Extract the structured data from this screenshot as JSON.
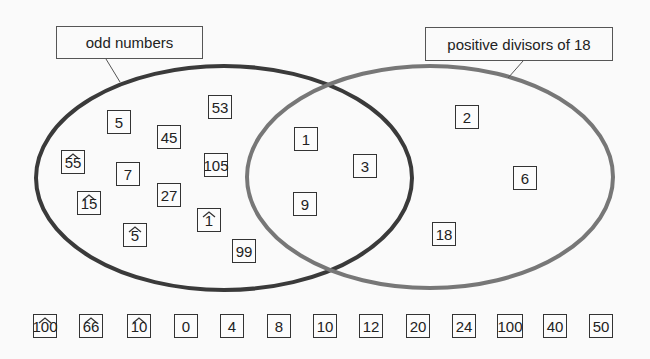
{
  "sets": {
    "left": {
      "label": "odd numbers",
      "stroke": "#3a3a3a"
    },
    "right": {
      "label": "positive divisors of 18",
      "stroke": "#777777"
    }
  },
  "only_left": [
    {
      "value": "53",
      "hat": false,
      "x": 208,
      "y": 95,
      "w": 24,
      "h": 24
    },
    {
      "value": "5",
      "hat": false,
      "x": 107,
      "y": 110,
      "w": 24,
      "h": 24
    },
    {
      "value": "45",
      "hat": false,
      "x": 157,
      "y": 125,
      "w": 24,
      "h": 24
    },
    {
      "value": "55",
      "hat": true,
      "x": 61,
      "y": 150,
      "w": 24,
      "h": 24
    },
    {
      "value": "105",
      "hat": false,
      "x": 204,
      "y": 153,
      "w": 24,
      "h": 24
    },
    {
      "value": "7",
      "hat": false,
      "x": 116,
      "y": 162,
      "w": 24,
      "h": 24
    },
    {
      "value": "27",
      "hat": false,
      "x": 157,
      "y": 183,
      "w": 24,
      "h": 24
    },
    {
      "value": "15",
      "hat": true,
      "x": 77,
      "y": 191,
      "w": 24,
      "h": 24
    },
    {
      "value": "1",
      "hat": true,
      "x": 197,
      "y": 208,
      "w": 24,
      "h": 24
    },
    {
      "value": "5",
      "hat": true,
      "x": 123,
      "y": 223,
      "w": 24,
      "h": 24
    },
    {
      "value": "99",
      "hat": false,
      "x": 232,
      "y": 239,
      "w": 24,
      "h": 24
    }
  ],
  "intersection": [
    {
      "value": "1",
      "hat": false,
      "x": 294,
      "y": 127,
      "w": 24,
      "h": 24
    },
    {
      "value": "3",
      "hat": false,
      "x": 353,
      "y": 154,
      "w": 24,
      "h": 24
    },
    {
      "value": "9",
      "hat": false,
      "x": 293,
      "y": 192,
      "w": 24,
      "h": 24
    }
  ],
  "only_right": [
    {
      "value": "2",
      "hat": false,
      "x": 455,
      "y": 105,
      "w": 24,
      "h": 24
    },
    {
      "value": "6",
      "hat": false,
      "x": 513,
      "y": 166,
      "w": 24,
      "h": 24
    },
    {
      "value": "18",
      "hat": false,
      "x": 432,
      "y": 222,
      "w": 24,
      "h": 24
    }
  ],
  "outside": [
    {
      "value": "100",
      "hat": true,
      "x": 33,
      "y": 314,
      "w": 24,
      "h": 24
    },
    {
      "value": "66",
      "hat": true,
      "x": 79,
      "y": 314,
      "w": 24,
      "h": 24
    },
    {
      "value": "10",
      "hat": true,
      "x": 127,
      "y": 314,
      "w": 24,
      "h": 24
    },
    {
      "value": "0",
      "hat": false,
      "x": 174,
      "y": 314,
      "w": 24,
      "h": 24
    },
    {
      "value": "4",
      "hat": false,
      "x": 220,
      "y": 314,
      "w": 24,
      "h": 24
    },
    {
      "value": "8",
      "hat": false,
      "x": 267,
      "y": 314,
      "w": 24,
      "h": 24
    },
    {
      "value": "10",
      "hat": false,
      "x": 313,
      "y": 314,
      "w": 24,
      "h": 24
    },
    {
      "value": "12",
      "hat": false,
      "x": 359,
      "y": 314,
      "w": 24,
      "h": 24
    },
    {
      "value": "20",
      "hat": false,
      "x": 406,
      "y": 314,
      "w": 24,
      "h": 24
    },
    {
      "value": "24",
      "hat": false,
      "x": 452,
      "y": 314,
      "w": 24,
      "h": 24
    },
    {
      "value": "100",
      "hat": false,
      "x": 497,
      "y": 314,
      "w": 26,
      "h": 24
    },
    {
      "value": "40",
      "hat": false,
      "x": 543,
      "y": 314,
      "w": 24,
      "h": 24
    },
    {
      "value": "50",
      "hat": false,
      "x": 589,
      "y": 314,
      "w": 24,
      "h": 24
    }
  ]
}
